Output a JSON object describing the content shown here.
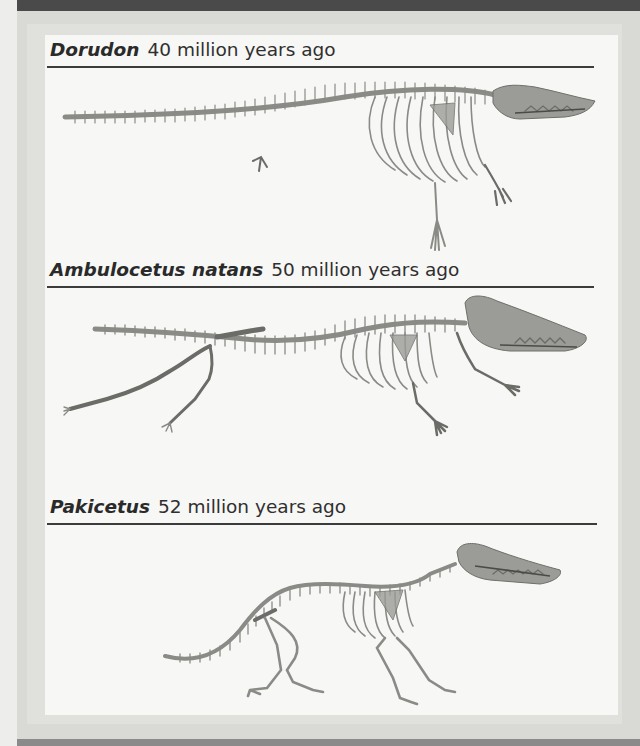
{
  "page": {
    "colors": {
      "top_bar": "#4a4a4a",
      "frame": "#d9d9d6",
      "panel": "#f7f7f5",
      "text": "#2f2f2f",
      "rule": "#3c3c3c",
      "bone": "#8a8a86"
    }
  },
  "sections": [
    {
      "genus": "Dorudon",
      "age": "40 million years ago",
      "figure": "dorudon-skeleton"
    },
    {
      "genus": "Ambulocetus natans",
      "age": "50 million years ago",
      "figure": "ambulocetus-skeleton"
    },
    {
      "genus": "Pakicetus",
      "age": "52 million years ago",
      "figure": "pakicetus-skeleton"
    }
  ]
}
